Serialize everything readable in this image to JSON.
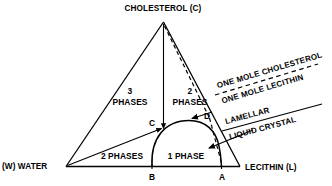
{
  "figure": {
    "type": "ternary-phase-diagram",
    "title": "",
    "background_color": "#ffffff",
    "line_color": "#000000"
  },
  "vertices": {
    "top": {
      "label": "CHOLESTEROL (C)",
      "name": "cholesterol"
    },
    "left": {
      "label": "(W) WATER",
      "name": "water"
    },
    "right": {
      "label": "LECITHIN (L)",
      "name": "lecithin"
    }
  },
  "regions": [
    {
      "id": "three-phases",
      "line1": "3",
      "line2": "PHASES"
    },
    {
      "id": "two-phases-upper",
      "line1": "2",
      "line2": "PHASES"
    },
    {
      "id": "two-phases-lower",
      "label": "2 PHASES"
    },
    {
      "id": "one-phase",
      "label": "1 PHASE"
    }
  ],
  "points": [
    {
      "id": "point-c",
      "label": "C"
    },
    {
      "id": "point-d",
      "label": "D"
    },
    {
      "id": "point-b",
      "label": "B"
    },
    {
      "id": "point-a",
      "label": "A"
    }
  ],
  "annotations": {
    "ratio": {
      "numerator": "ONE MOLE CHOLESTEROL",
      "denominator": "ONE MOLE LECITHIN"
    },
    "phase_name": {
      "line1": "LAMELLAR",
      "line2": "LIQUID CRYSTAL"
    }
  }
}
